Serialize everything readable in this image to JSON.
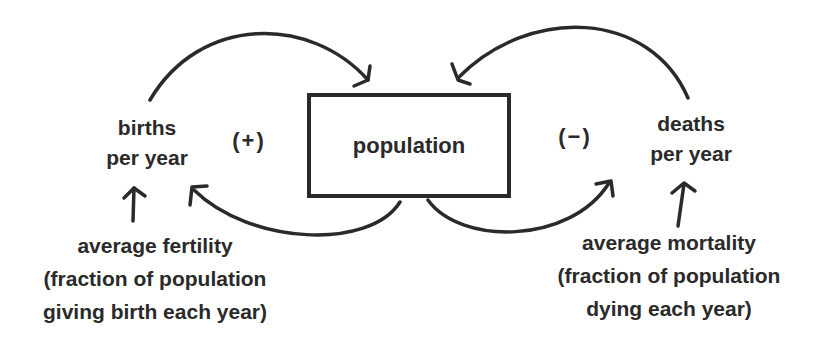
{
  "diagram": {
    "stock": {
      "label": "population"
    },
    "flows": {
      "births": {
        "line1": "births",
        "line2": "per year"
      },
      "deaths": {
        "line1": "deaths",
        "line2": "per year"
      }
    },
    "loops": {
      "reinforcing": "(+)",
      "balancing": "(−)"
    },
    "parameters": {
      "fertility": {
        "line1": "average fertility",
        "line2": "(fraction of population",
        "line3": "giving birth each year)"
      },
      "mortality": {
        "line1": "average mortality",
        "line2": "(fraction of population",
        "line3": "dying each year)"
      }
    },
    "colors": {
      "ink": "#2a2a2a",
      "background": "#ffffff"
    }
  }
}
